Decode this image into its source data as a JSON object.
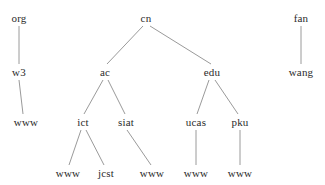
{
  "diagram": {
    "type": "tree",
    "style": {
      "background_color": "#ffffff",
      "edge_color": "#9a9a9a",
      "text_color": "#2b2b2b",
      "edge_width": 1
    },
    "nodes": [
      {
        "id": "org",
        "label": "org",
        "x": 19,
        "y": 18,
        "level": 0
      },
      {
        "id": "cn",
        "label": "cn",
        "x": 146,
        "y": 18,
        "level": 0
      },
      {
        "id": "fan",
        "label": "fan",
        "x": 301,
        "y": 18,
        "level": 0
      },
      {
        "id": "w3",
        "label": "w3",
        "x": 19,
        "y": 72,
        "level": 1
      },
      {
        "id": "ac",
        "label": "ac",
        "x": 105,
        "y": 72,
        "level": 1
      },
      {
        "id": "edu",
        "label": "edu",
        "x": 212,
        "y": 72,
        "level": 1
      },
      {
        "id": "wang",
        "label": "wang",
        "x": 301,
        "y": 72,
        "level": 1
      },
      {
        "id": "w3www",
        "label": "www",
        "x": 26,
        "y": 122,
        "level": 2
      },
      {
        "id": "ict",
        "label": "ict",
        "x": 83,
        "y": 122,
        "level": 2
      },
      {
        "id": "siat",
        "label": "siat",
        "x": 126,
        "y": 122,
        "level": 2
      },
      {
        "id": "ucas",
        "label": "ucas",
        "x": 196,
        "y": 122,
        "level": 2
      },
      {
        "id": "pku",
        "label": "pku",
        "x": 240,
        "y": 122,
        "level": 2
      },
      {
        "id": "ictwww",
        "label": "www",
        "x": 68,
        "y": 173,
        "level": 3
      },
      {
        "id": "jcst",
        "label": "jcst",
        "x": 106,
        "y": 173,
        "level": 3
      },
      {
        "id": "siatwww",
        "label": "www",
        "x": 152,
        "y": 173,
        "level": 3
      },
      {
        "id": "ucaswww",
        "label": "www",
        "x": 196,
        "y": 173,
        "level": 3
      },
      {
        "id": "pkuwww",
        "label": "www",
        "x": 240,
        "y": 173,
        "level": 3
      }
    ],
    "edges": [
      {
        "from": "org",
        "to": "w3",
        "x1": 19,
        "y1": 26,
        "x2": 19,
        "y2": 64
      },
      {
        "from": "w3",
        "to": "w3www",
        "x1": 19,
        "y1": 80,
        "x2": 23,
        "y2": 114
      },
      {
        "from": "cn",
        "to": "ac",
        "x1": 143,
        "y1": 26,
        "x2": 107,
        "y2": 64
      },
      {
        "from": "cn",
        "to": "edu",
        "x1": 150,
        "y1": 26,
        "x2": 211,
        "y2": 64
      },
      {
        "from": "ac",
        "to": "ict",
        "x1": 103,
        "y1": 80,
        "x2": 84,
        "y2": 114
      },
      {
        "from": "ac",
        "to": "siat",
        "x1": 108,
        "y1": 80,
        "x2": 125,
        "y2": 114
      },
      {
        "from": "ict",
        "to": "ictwww",
        "x1": 81,
        "y1": 130,
        "x2": 69,
        "y2": 165
      },
      {
        "from": "ict",
        "to": "jcst",
        "x1": 86,
        "y1": 130,
        "x2": 104,
        "y2": 165
      },
      {
        "from": "siat",
        "to": "siatwww",
        "x1": 127,
        "y1": 130,
        "x2": 151,
        "y2": 165
      },
      {
        "from": "edu",
        "to": "ucas",
        "x1": 209,
        "y1": 80,
        "x2": 197,
        "y2": 114
      },
      {
        "from": "edu",
        "to": "pku",
        "x1": 215,
        "y1": 80,
        "x2": 238,
        "y2": 114
      },
      {
        "from": "ucas",
        "to": "ucaswww",
        "x1": 196,
        "y1": 130,
        "x2": 196,
        "y2": 165
      },
      {
        "from": "pku",
        "to": "pkuwww",
        "x1": 240,
        "y1": 130,
        "x2": 240,
        "y2": 165
      },
      {
        "from": "fan",
        "to": "wang",
        "x1": 301,
        "y1": 26,
        "x2": 301,
        "y2": 64
      }
    ]
  }
}
